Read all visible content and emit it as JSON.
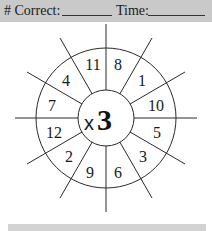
{
  "header": {
    "correct_label": "# Correct:",
    "time_label": "Time:"
  },
  "wheel": {
    "operator": "x",
    "multiplier": "3",
    "numbers": [
      "8",
      "1",
      "10",
      "5",
      "3",
      "6",
      "9",
      "2",
      "12",
      "7",
      "4",
      "11"
    ]
  },
  "colors": {
    "band": "#c9c9c9",
    "ink": "#1a1a1a"
  }
}
